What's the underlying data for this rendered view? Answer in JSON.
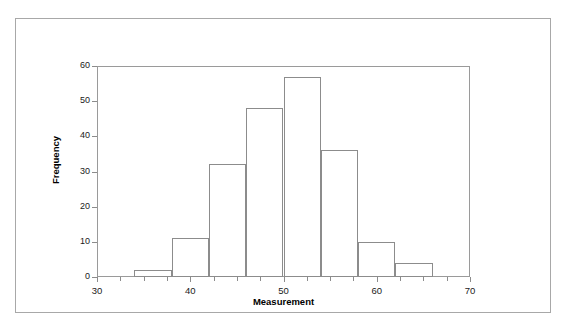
{
  "figure": {
    "background_color": "#ffffff",
    "line_color": "#8c8c8c",
    "frame_color": "#a8a8a8",
    "text_color": "#1a1a1a"
  },
  "chart_data": {
    "type": "bar",
    "title": "",
    "subtitle": "",
    "xlabel": "Measurement",
    "ylabel": "Frequency",
    "xlim": [
      30,
      70
    ],
    "ylim": [
      0,
      60
    ],
    "grid": false,
    "legend": false,
    "legend_position": "none",
    "bin_width": 4,
    "bin_edges": [
      34,
      38,
      42,
      46,
      50,
      54,
      58,
      62,
      66
    ],
    "categories": [
      "34-38",
      "38-42",
      "42-46",
      "46-50",
      "50-54",
      "54-58",
      "58-62",
      "62-66"
    ],
    "values": [
      2,
      11,
      32,
      48,
      57,
      36,
      10,
      4
    ],
    "bars": [
      {
        "start": 34,
        "end": 38,
        "value": 2
      },
      {
        "start": 38,
        "end": 42,
        "value": 11
      },
      {
        "start": 42,
        "end": 46,
        "value": 32
      },
      {
        "start": 46,
        "end": 50,
        "value": 48
      },
      {
        "start": 50,
        "end": 54,
        "value": 57
      },
      {
        "start": 54,
        "end": 58,
        "value": 36
      },
      {
        "start": 58,
        "end": 62,
        "value": 10
      },
      {
        "start": 62,
        "end": 66,
        "value": 4
      }
    ],
    "xticks": [
      30,
      40,
      50,
      60,
      70
    ],
    "xtick_labels": [
      "30",
      "40",
      "50",
      "60",
      "70"
    ],
    "xticks_minor": [
      32.5,
      35,
      37.5,
      42.5,
      45,
      47.5,
      52.5,
      55,
      57.5,
      62.5,
      65,
      67.5
    ],
    "yticks": [
      0,
      10,
      20,
      30,
      40,
      50,
      60
    ],
    "ytick_labels": [
      "0",
      "10",
      "20",
      "30",
      "40",
      "50",
      "60"
    ]
  }
}
